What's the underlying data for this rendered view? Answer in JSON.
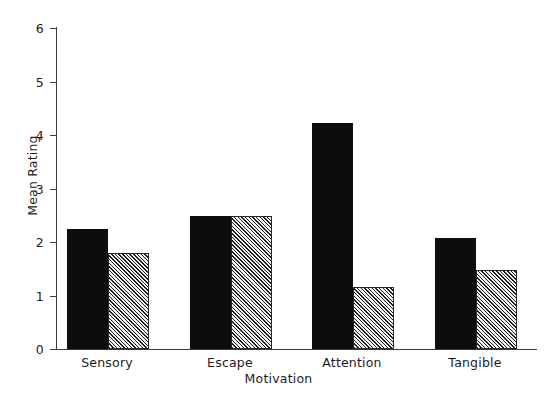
{
  "chart_data": {
    "type": "bar",
    "title": "",
    "xlabel": "Motivation",
    "ylabel": "Mean Rating",
    "categories": [
      "Sensory",
      "Escape",
      "Attention",
      "Tangible"
    ],
    "series": [
      {
        "name": "solid-black-series",
        "fill": "solid",
        "values": [
          2.25,
          2.48,
          4.22,
          2.07
        ]
      },
      {
        "name": "hatched-series",
        "fill": "hatched",
        "values": [
          1.8,
          2.48,
          1.15,
          1.48
        ]
      }
    ],
    "ylim": [
      0,
      6
    ],
    "yticks": [
      0,
      1,
      2,
      3,
      4,
      5,
      6
    ],
    "ytick_labels": [
      "0",
      "1",
      "2",
      "3",
      "4",
      "5",
      "6"
    ],
    "grid": false,
    "legend": "none",
    "colors": {
      "solid": "#0d0d0d",
      "hatch_line": "#1e1e1e",
      "hatch_background": "#f2f2f2",
      "axis": "#3a3a3a",
      "text": "#1c1c1c",
      "background": "#ffffff"
    }
  }
}
